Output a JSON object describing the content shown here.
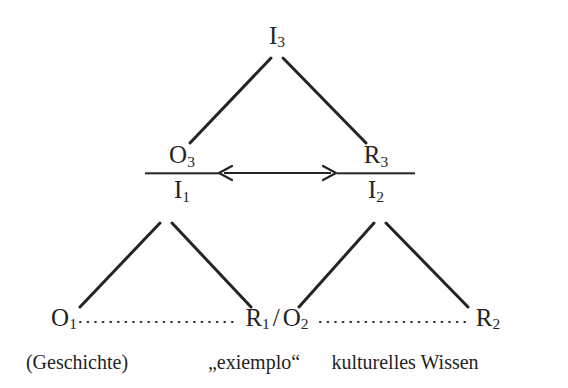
{
  "diagram": {
    "type": "tree-diagram",
    "title": "",
    "background_color": "#ffffff",
    "stroke_color": "#242424",
    "nodes": {
      "apex": {
        "label": "I",
        "sub": "3"
      },
      "left_fraction": {
        "numerator": {
          "label": "O",
          "sub": "3"
        },
        "denominator": {
          "label": "I",
          "sub": "1"
        }
      },
      "right_fraction": {
        "numerator": {
          "label": "R",
          "sub": "3"
        },
        "denominator": {
          "label": "I",
          "sub": "2"
        }
      },
      "bottom_left": {
        "label": "O",
        "sub": "1"
      },
      "bottom_middle": {
        "left": {
          "label": "R",
          "sub": "1"
        },
        "separator": "/",
        "right": {
          "label": "O",
          "sub": "2"
        }
      },
      "bottom_right": {
        "label": "R",
        "sub": "2"
      }
    },
    "captions": {
      "left": "(Geschichte)",
      "middle": "„exiemplo“",
      "right": "kulturelles Wissen"
    },
    "connectors": {
      "bidirectional_arrow": "↔",
      "dotted_left_label": "",
      "dotted_right_label": ""
    }
  }
}
